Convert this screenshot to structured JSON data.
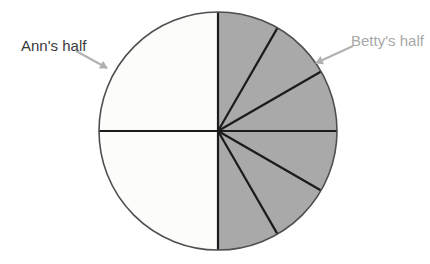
{
  "figure": {
    "ann_label": "Ann's half",
    "betty_label": "Betty's half"
  },
  "colors": {
    "background": "#ffffff",
    "ann_fill": "#fcfcfa",
    "betty_fill": "#a9a9a9",
    "divider_line": "#1b1b1b",
    "circle_outline": "#4f4f4f",
    "arrow": "#b1b1b1",
    "ann_label_text": "#3a3a3a",
    "betty_label_text": "#a8a8a8"
  },
  "chart_data": {
    "type": "pie",
    "direction": "clockwise",
    "start_angle_degrees_from_top": 0,
    "slices": [
      {
        "group": "Betty's half",
        "degrees": 30,
        "fill": "#a9a9a9"
      },
      {
        "group": "Betty's half",
        "degrees": 30,
        "fill": "#a9a9a9"
      },
      {
        "group": "Betty's half",
        "degrees": 30,
        "fill": "#a9a9a9"
      },
      {
        "group": "Betty's half",
        "degrees": 30,
        "fill": "#a9a9a9"
      },
      {
        "group": "Betty's half",
        "degrees": 30,
        "fill": "#a9a9a9"
      },
      {
        "group": "Betty's half",
        "degrees": 30,
        "fill": "#a9a9a9"
      },
      {
        "group": "Ann's half",
        "degrees": 90,
        "fill": "#fcfcfa"
      },
      {
        "group": "Ann's half",
        "degrees": 90,
        "fill": "#fcfcfa"
      }
    ],
    "halves": [
      {
        "name": "Ann's half",
        "fraction": 0.5,
        "num_slices": 2,
        "fill": "#fcfcfa"
      },
      {
        "name": "Betty's half",
        "fraction": 0.5,
        "num_slices": 6,
        "fill": "#a9a9a9"
      }
    ],
    "annotations": [
      {
        "text": "Ann's half",
        "points_to": "left half of circle"
      },
      {
        "text": "Betty's half",
        "points_to": "right half of circle"
      }
    ],
    "legend": "none",
    "title": ""
  }
}
